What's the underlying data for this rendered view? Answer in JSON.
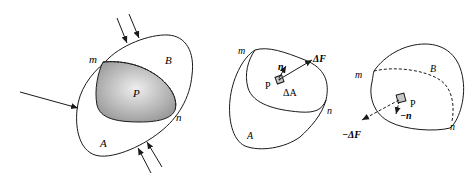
{
  "figure": {
    "panels": [
      {
        "id": "whole-body",
        "labels": {
          "m": "m",
          "B": "B",
          "P": "P",
          "n": "n",
          "A": "A"
        },
        "section_fill": "#b8b8b8",
        "external_forces": 5
      },
      {
        "id": "part-A",
        "labels": {
          "m": "m",
          "n": "n",
          "A": "A",
          "P": "P",
          "normal": "n",
          "force": "ΔF",
          "area": "ΔA"
        }
      },
      {
        "id": "part-B",
        "labels": {
          "m": "m",
          "n": "n",
          "B": "B",
          "P": "P",
          "normal": "−n",
          "force": "−ΔF"
        }
      }
    ],
    "colors": {
      "stroke": "#1a1a1a",
      "background": "#ffffff",
      "shade_light": "#e6e6e6",
      "shade_dark": "#9a9a9a"
    }
  }
}
